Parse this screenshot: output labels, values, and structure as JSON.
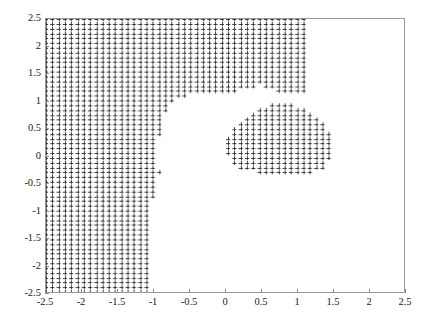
{
  "figure": {
    "title": "",
    "background_color": "#ffffff",
    "axis_color": "#9a9a9a",
    "marker_color": "#2b2b2b"
  },
  "chart_data": {
    "type": "scatter",
    "title": "",
    "xlabel": "",
    "ylabel": "",
    "xlim": [
      -2.5,
      2.5
    ],
    "ylim": [
      -2.5,
      2.5
    ],
    "grid": false,
    "legend": null,
    "marker": "+",
    "marker_color": "#2b2b2b",
    "marker_size": 4.2,
    "xticks": [
      -2.5,
      -2,
      -1.5,
      -1,
      -0.5,
      0,
      0.5,
      1,
      1.5,
      2,
      2.5
    ],
    "xticklabels": [
      "-2.5",
      "-2",
      "-1.5",
      "-1",
      "-0.5",
      "0",
      "0.5",
      "1",
      "1.5",
      "2",
      "2.5"
    ],
    "yticks": [
      -2.5,
      -2,
      -1.5,
      -1,
      -0.5,
      0,
      0.5,
      1,
      1.5,
      2,
      2.5
    ],
    "yticklabels": [
      "-2.5",
      "-2",
      "-1.5",
      "-1",
      "-0.5",
      "0",
      "0.5",
      "1",
      "1.5",
      "2",
      "2.5"
    ],
    "grid_step": 0.0877,
    "grid_origin": [
      -2.5,
      -2.5
    ],
    "regions": [
      {
        "name": "left-block",
        "note": "filled from x=-2.5 to a boundary that bulges right near y=2.5 and tapers to x=-1.05 near y=-2.5"
      },
      {
        "name": "right-blob",
        "note": "rounded lobe centred near (0.7, 0.25) with radius about 0.7, merging upward into the top strip"
      },
      {
        "name": "top-strip",
        "note": "filled band across the top from x=-2.5 to x=1.12 at y=2.5"
      },
      {
        "name": "isolated-point",
        "note": "single marker near (-0.9, -0.3)"
      }
    ],
    "boundary_left": [
      {
        "y": 2.5,
        "x": 1.12
      },
      {
        "y": 2.3,
        "x": 1.1
      },
      {
        "y": 2.1,
        "x": 1.1
      },
      {
        "y": 1.9,
        "x": 1.09
      },
      {
        "y": 1.7,
        "x": 1.08
      },
      {
        "y": 1.5,
        "x": 1.05
      },
      {
        "y": 1.4,
        "x": 0.78
      },
      {
        "y": 1.3,
        "x": 0.55
      },
      {
        "y": 1.2,
        "x": 0.3
      },
      {
        "y": 1.1,
        "x": -0.5
      },
      {
        "y": 1.0,
        "x": -0.72
      },
      {
        "y": 0.9,
        "x": -0.8
      },
      {
        "y": 0.8,
        "x": -0.85
      },
      {
        "y": 0.6,
        "x": -0.88
      },
      {
        "y": 0.4,
        "x": -0.92
      },
      {
        "y": 0.2,
        "x": -0.95
      },
      {
        "y": 0.0,
        "x": -0.98
      },
      {
        "y": -0.2,
        "x": -1.0
      },
      {
        "y": -0.4,
        "x": -1.0
      },
      {
        "y": -0.6,
        "x": -1.0
      },
      {
        "y": -1.0,
        "x": -1.02
      },
      {
        "y": -1.5,
        "x": -1.03
      },
      {
        "y": -2.0,
        "x": -1.04
      },
      {
        "y": -2.5,
        "x": -1.05
      }
    ]
  },
  "axes": {
    "y_labels": [
      "2.5",
      "2",
      "1.5",
      "1",
      "0.5",
      "0",
      "-0.5",
      "-1",
      "-1.5",
      "-2",
      "-2.5"
    ],
    "x_labels": [
      "-2.5",
      "-2",
      "-1.5",
      "-1",
      "-0.5",
      "0",
      "0.5",
      "1",
      "1.5",
      "2",
      "2.5"
    ]
  }
}
